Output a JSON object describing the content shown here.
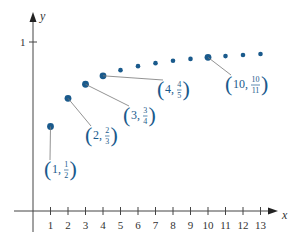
{
  "chart_data": {
    "type": "scatter",
    "title": "",
    "xlabel": "x",
    "ylabel": "y",
    "xlim": [
      0,
      13.5
    ],
    "ylim": [
      0,
      1.1
    ],
    "grid": false,
    "x_ticks": [
      "1",
      "2",
      "3",
      "4",
      "5",
      "6",
      "7",
      "8",
      "9",
      "10",
      "11",
      "12",
      "13"
    ],
    "y_ticks": [
      "1"
    ],
    "color": "#1a5a8c",
    "series": [
      {
        "name": "n/(n+1)",
        "x": [
          1,
          2,
          3,
          4,
          5,
          6,
          7,
          8,
          9,
          10,
          11,
          12,
          13
        ],
        "values": [
          0.5,
          0.6667,
          0.75,
          0.8,
          0.8333,
          0.8571,
          0.875,
          0.8889,
          0.9,
          0.9091,
          0.9167,
          0.9231,
          0.9286
        ],
        "highlighted": [
          1,
          2,
          3,
          4,
          10
        ]
      }
    ],
    "annotations": [
      {
        "x": 1,
        "label_int": "1",
        "num": "1",
        "den": "2"
      },
      {
        "x": 2,
        "label_int": "2",
        "num": "2",
        "den": "3"
      },
      {
        "x": 3,
        "label_int": "3",
        "num": "3",
        "den": "4"
      },
      {
        "x": 4,
        "label_int": "4",
        "num": "4",
        "den": "5"
      },
      {
        "x": 10,
        "label_int": "10",
        "num": "10",
        "den": "11"
      }
    ]
  }
}
